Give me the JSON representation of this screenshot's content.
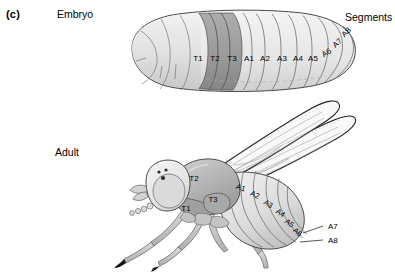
{
  "figure": {
    "panel_label": "(c)",
    "stage_labels": {
      "embryo": "Embryo",
      "adult": "Adult"
    },
    "annotations": {
      "segments": "Segments"
    },
    "colors": {
      "outline": "#4a4a4a",
      "outline_dark": "#111111",
      "thoracic_fill": "#9b9b9b",
      "abdominal_fill": "#e3e3e3",
      "head_fill": "#ededed",
      "body_fill": "#dcdcdc",
      "wing_fill": "#fbfbfb",
      "leg_fill": "#c8c8c8",
      "label_text": "#000000"
    }
  },
  "embryo": {
    "segments": [
      {
        "label": "T1",
        "class": "thoracic",
        "x": 198,
        "y": 61
      },
      {
        "label": "T2",
        "class": "thoracic",
        "x": 215,
        "y": 61
      },
      {
        "label": "T3",
        "class": "thoracic",
        "x": 232,
        "y": 61
      },
      {
        "label": "A1",
        "class": "abdominal",
        "x": 250,
        "y": 61
      },
      {
        "label": "A2",
        "class": "abdominal",
        "x": 266,
        "y": 61
      },
      {
        "label": "A3",
        "class": "abdominal",
        "x": 283,
        "y": 61
      },
      {
        "label": "A4",
        "class": "abdominal",
        "x": 299,
        "y": 61
      },
      {
        "label": "A5",
        "class": "abdominal",
        "x": 314,
        "y": 61
      },
      {
        "label": "A6",
        "class": "abdominal",
        "x": 329,
        "y": 54
      },
      {
        "label": "A7",
        "class": "abdominal",
        "x": 340,
        "y": 45
      },
      {
        "label": "A8",
        "class": "abdominal",
        "x": 349,
        "y": 35
      }
    ]
  },
  "adult": {
    "segments": [
      {
        "label": "T1",
        "x": 186,
        "y": 210
      },
      {
        "label": "T2",
        "x": 193,
        "y": 180
      },
      {
        "label": "T3",
        "x": 211,
        "y": 199
      },
      {
        "label": "A1",
        "x": 240,
        "y": 190
      },
      {
        "label": "A2",
        "x": 256,
        "y": 196
      },
      {
        "label": "A3",
        "x": 269,
        "y": 205
      },
      {
        "label": "A4",
        "x": 281,
        "y": 214
      },
      {
        "label": "A5",
        "x": 290,
        "y": 224
      },
      {
        "label": "A6",
        "x": 298,
        "y": 233
      }
    ],
    "callouts": [
      {
        "label": "A7",
        "text_x": 328,
        "text_y": 228,
        "line": [
          324,
          226,
          305,
          232
        ]
      },
      {
        "label": "A8",
        "text_x": 328,
        "text_y": 242,
        "line": [
          324,
          240,
          303,
          241
        ]
      }
    ]
  }
}
